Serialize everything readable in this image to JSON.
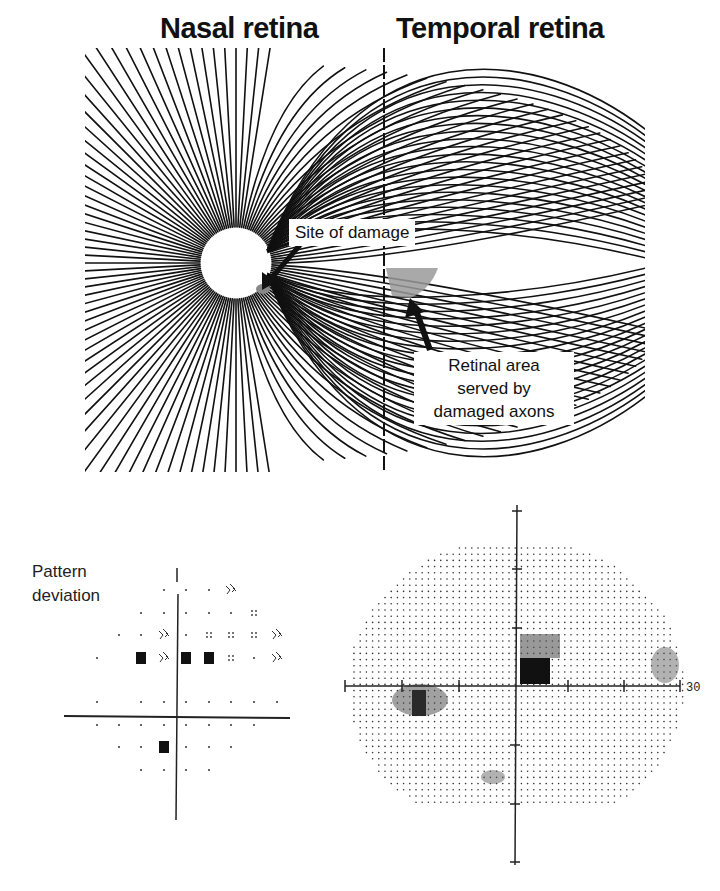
{
  "figure": {
    "top_panel": {
      "titles": {
        "nasal": "Nasal retina",
        "temporal": "Temporal retina"
      },
      "annotations": {
        "site_of_damage": "Site of damage",
        "retinal_area": [
          "Retinal area",
          "served by",
          "damaged axons"
        ]
      },
      "colors": {
        "lines": "#111111",
        "damage_shade": "#9a9a9a",
        "background": "#ffffff"
      }
    },
    "bottom_left_panel": {
      "label": [
        "Pattern",
        "deviation"
      ]
    },
    "bottom_right_panel": {
      "axis_label": "30"
    }
  }
}
